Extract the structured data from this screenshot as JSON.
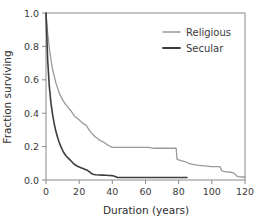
{
  "chart_data": {
    "type": "line",
    "title": "",
    "subtitle": "",
    "xlabel": "Duration (years)",
    "ylabel": "Fraction surviving",
    "xlim": [
      0,
      120
    ],
    "ylim": [
      0,
      1.0
    ],
    "xticks": [
      0,
      20,
      40,
      60,
      80,
      100,
      120
    ],
    "xtick_labels": [
      "0",
      "20",
      "40",
      "60",
      "80",
      "100",
      "120"
    ],
    "yticks": [
      0.0,
      0.2,
      0.4,
      0.6,
      0.8,
      1.0
    ],
    "ytick_labels": [
      "0.0",
      "0.2",
      "0.4",
      "0.6",
      "0.8",
      "1.0"
    ],
    "grid": false,
    "legend_position": "top-right",
    "frame": true,
    "series": [
      {
        "name": "Religious",
        "color": "#9a9a9a",
        "width": 1.3,
        "x": [
          0,
          1,
          2,
          3,
          4,
          5,
          6,
          7,
          8,
          9,
          10,
          11,
          12,
          13,
          14,
          15,
          16,
          17,
          18,
          19,
          20,
          21,
          22,
          23,
          24,
          25,
          26,
          27,
          28,
          29,
          30,
          31,
          32,
          33,
          34,
          35,
          36,
          37,
          38,
          39,
          40,
          42,
          45,
          50,
          55,
          58,
          60,
          62,
          65,
          68,
          70,
          72,
          74,
          76,
          78,
          78.5,
          79,
          80,
          81,
          82,
          83,
          84,
          85,
          86,
          88,
          90,
          92,
          94,
          96,
          98,
          100,
          102,
          103,
          104,
          105,
          106,
          108,
          110,
          112,
          113,
          114,
          115,
          116,
          118,
          120
        ],
        "y": [
          1.0,
          0.88,
          0.79,
          0.72,
          0.66,
          0.62,
          0.58,
          0.55,
          0.52,
          0.5,
          0.48,
          0.465,
          0.45,
          0.44,
          0.425,
          0.415,
          0.4,
          0.385,
          0.375,
          0.368,
          0.36,
          0.35,
          0.342,
          0.335,
          0.33,
          0.315,
          0.3,
          0.285,
          0.275,
          0.265,
          0.255,
          0.25,
          0.24,
          0.235,
          0.23,
          0.225,
          0.218,
          0.21,
          0.205,
          0.2,
          0.195,
          0.195,
          0.195,
          0.195,
          0.195,
          0.195,
          0.195,
          0.195,
          0.19,
          0.19,
          0.19,
          0.19,
          0.19,
          0.19,
          0.19,
          0.19,
          0.125,
          0.12,
          0.118,
          0.115,
          0.112,
          0.11,
          0.105,
          0.1,
          0.095,
          0.09,
          0.088,
          0.086,
          0.084,
          0.082,
          0.08,
          0.08,
          0.08,
          0.08,
          0.078,
          0.055,
          0.05,
          0.048,
          0.045,
          0.042,
          0.035,
          0.025,
          0.02,
          0.018,
          0.018
        ]
      },
      {
        "name": "Secular",
        "color": "#3c3c3c",
        "width": 1.6,
        "x": [
          0,
          1,
          2,
          3,
          4,
          5,
          6,
          7,
          8,
          9,
          10,
          11,
          12,
          13,
          14,
          15,
          16,
          17,
          18,
          19,
          20,
          21,
          22,
          23,
          24,
          25,
          26,
          27,
          28,
          29,
          30,
          32,
          34,
          36,
          38,
          40,
          41,
          42,
          43,
          44,
          46,
          50,
          55,
          60,
          65,
          70,
          75,
          80,
          84,
          85
        ],
        "y": [
          1.0,
          0.72,
          0.56,
          0.46,
          0.39,
          0.335,
          0.29,
          0.255,
          0.225,
          0.2,
          0.178,
          0.16,
          0.145,
          0.135,
          0.125,
          0.115,
          0.105,
          0.094,
          0.088,
          0.082,
          0.078,
          0.074,
          0.07,
          0.066,
          0.062,
          0.058,
          0.05,
          0.042,
          0.036,
          0.033,
          0.031,
          0.03,
          0.029,
          0.028,
          0.027,
          0.026,
          0.024,
          0.02,
          0.016,
          0.015,
          0.015,
          0.015,
          0.015,
          0.015,
          0.015,
          0.015,
          0.015,
          0.015,
          0.015,
          0.015
        ]
      }
    ],
    "legend": [
      {
        "label": "Religious",
        "color": "#9a9a9a"
      },
      {
        "label": "Secular",
        "color": "#3c3c3c"
      }
    ]
  },
  "style": {
    "background": "#ffffff",
    "axis_color": "#8a8a8a",
    "text_color": "#3a3a3a"
  }
}
